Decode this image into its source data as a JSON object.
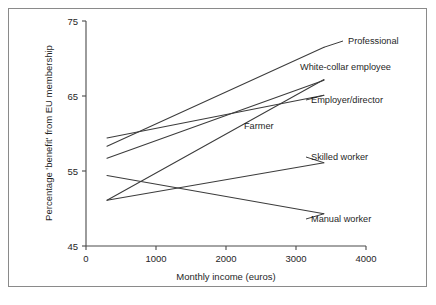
{
  "chart_data": {
    "type": "line",
    "title": "",
    "xlabel": "Monthly income (euros)",
    "ylabel": "Percentage 'benefit' from EU membership",
    "xlim": [
      0,
      4000
    ],
    "ylim": [
      45,
      75
    ],
    "xticks": [
      "0",
      "1000",
      "2000",
      "3000",
      "4000"
    ],
    "xtick_values": [
      0,
      1000,
      2000,
      3000,
      4000
    ],
    "yticks": [
      "45",
      "55",
      "65",
      "75"
    ],
    "ytick_values": [
      45,
      55,
      65,
      75
    ],
    "grid": false,
    "legend_position": "right-inline-labels",
    "series": [
      {
        "name": "Professional",
        "x": [
          300,
          3400
        ],
        "values": [
          58.3,
          71.5
        ],
        "label": "Professional",
        "label_x": 348,
        "label_y": 44
      },
      {
        "name": "White-collar employee",
        "x": [
          300,
          3400
        ],
        "values": [
          56.7,
          67.1
        ],
        "label": "White-collar employee",
        "label_x": 300,
        "label_y": 70
      },
      {
        "name": "Employer/director",
        "x": [
          300,
          3400
        ],
        "values": [
          59.4,
          65.1
        ],
        "label": "Employer/director",
        "label_x": 311,
        "label_y": 103
      },
      {
        "name": "Farmer",
        "x": [
          300,
          3400
        ],
        "values": [
          51.1,
          67.2
        ],
        "label": "Farmer",
        "label_x": 244,
        "label_y": 129
      },
      {
        "name": "Skilled worker",
        "x": [
          300,
          3400
        ],
        "values": [
          51.1,
          56.1
        ],
        "label": "Skilled worker",
        "label_x": 311,
        "label_y": 160
      },
      {
        "name": "Manual worker",
        "x": [
          300,
          3400
        ],
        "values": [
          54.4,
          49.3
        ],
        "label": "Manual worker",
        "label_x": 311,
        "label_y": 222
      }
    ]
  },
  "figure": {
    "border_color": "#8a8a8a",
    "line_color": "#3c3c3c",
    "background": "#ffffff"
  },
  "axes": {
    "x_title": "Monthly income (euros)",
    "y_title": "Percentage 'benefit' from EU membership",
    "x_tick_0": "0",
    "x_tick_1": "1000",
    "x_tick_2": "2000",
    "x_tick_3": "3000",
    "x_tick_4": "4000",
    "y_tick_0": "45",
    "y_tick_1": "55",
    "y_tick_2": "65",
    "y_tick_3": "75"
  }
}
